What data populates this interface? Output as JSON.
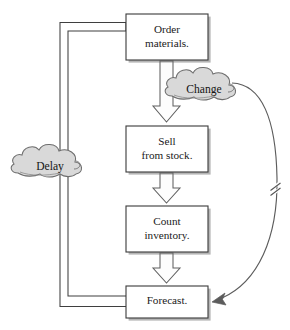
{
  "diagram": {
    "type": "flowchart",
    "background_color": "#ffffff",
    "box_fill": "#ffffff",
    "box_stroke": "#3a3a3a",
    "box_shadow_color": "#4a4a4a",
    "arrow_fill": "#ffffff",
    "arrow_stroke": "#555555",
    "cloud_fill": "#d9d9d9",
    "cloud_stroke": "#6e6e6e",
    "curve_stroke": "#5c5c5c",
    "nodes": [
      {
        "id": "order-materials",
        "label": "Order\nmaterials.",
        "x": 126,
        "y": 14,
        "width": 82,
        "height": 46
      },
      {
        "id": "sell-from-stock",
        "label": "Sell\nfrom stock.",
        "x": 126,
        "y": 126,
        "width": 82,
        "height": 46
      },
      {
        "id": "count-inventory",
        "label": "Count\ninventory.",
        "x": 126,
        "y": 206,
        "width": 82,
        "height": 46
      },
      {
        "id": "forecast",
        "label": "Forecast.",
        "x": 126,
        "y": 286,
        "width": 82,
        "height": 32
      }
    ],
    "clouds": [
      {
        "id": "change-cloud",
        "label": "Change",
        "cx": 204,
        "cy": 90,
        "rx": 38,
        "ry": 21
      },
      {
        "id": "delay-cloud",
        "label": "Delay",
        "cx": 49,
        "cy": 167,
        "rx": 37,
        "ry": 20
      }
    ],
    "connectors": [
      {
        "id": "order-to-sell",
        "from": "order-materials",
        "to": "sell-from-stock",
        "style": "block-arrow-down"
      },
      {
        "id": "sell-to-count",
        "from": "sell-from-stock",
        "to": "count-inventory",
        "style": "block-arrow-down"
      },
      {
        "id": "count-to-forecast",
        "from": "count-inventory",
        "to": "forecast",
        "style": "block-arrow-down"
      },
      {
        "id": "forecast-to-order-feedback",
        "from": "order-materials",
        "to": "forecast",
        "style": "block-arrow-outline-path",
        "passes_through": "delay-cloud"
      },
      {
        "id": "change-to-forecast-curve",
        "from": "change-cloud",
        "to": "forecast",
        "style": "thin-curved-arrow",
        "has_break_mark": true
      }
    ],
    "break_mark": {
      "id": "break-mark",
      "x": 262,
      "y": 188,
      "description": "double-slash break symbol on curve"
    }
  }
}
